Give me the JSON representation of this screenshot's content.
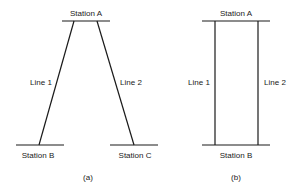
{
  "diagrams": [
    {
      "caption": "(a)",
      "top_station": "Station A",
      "bottom_stations": [
        "Station B",
        "Station C"
      ],
      "lines": [
        "Line 1",
        "Line 2"
      ]
    },
    {
      "caption": "(b)",
      "top_station": "Station A",
      "bottom_stations": [
        "Station B"
      ],
      "lines": [
        "Line 1",
        "Line 2"
      ]
    }
  ],
  "colors": {
    "ink": "#1a1a1a",
    "background": "#ffffff"
  }
}
